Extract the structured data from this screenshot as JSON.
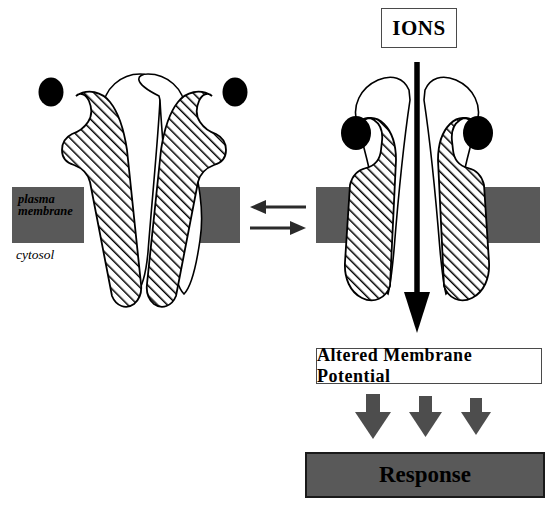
{
  "figure": {
    "labels": {
      "ions": "IONS",
      "altered_membrane_potential": "Altered Membrane Potential",
      "response": "Response",
      "plasma_membrane_line1": "plasma",
      "plasma_membrane_line2": "membrane",
      "cytosol": "cytosol"
    },
    "colors": {
      "membrane_gray": "#595959",
      "response_fill": "#595959",
      "response_border": "#1a1a1a",
      "arrow_gray": "#4d4d4d",
      "ligand_black": "#000000",
      "outline_black": "#000000",
      "background": "#ffffff",
      "box_border": "#4a4a4a"
    },
    "panels": [
      {
        "name": "closed-channel",
        "state": "closed",
        "ligands_bound": 0,
        "free_ligands": 2,
        "ion_flow": false
      },
      {
        "name": "open-channel",
        "state": "open",
        "ligands_bound": 2,
        "free_ligands": 0,
        "ion_flow": true
      }
    ],
    "equilibrium": {
      "top_arrow_direction": "left",
      "bottom_arrow_direction": "right"
    },
    "response_arrows": {
      "count": 3,
      "direction": "down"
    }
  }
}
